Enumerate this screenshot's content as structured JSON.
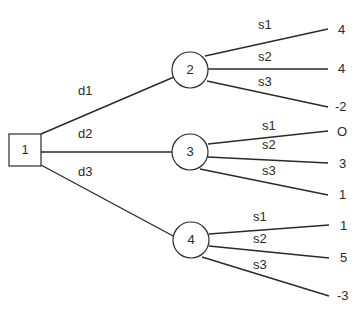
{
  "diagram": {
    "type": "decision-tree",
    "colors": {
      "line": "#2a2a2a",
      "background": "#ffffff"
    },
    "decision_node": {
      "id": "1",
      "label": "1",
      "shape": "square"
    },
    "decisions": [
      {
        "label": "d1",
        "chance_node": {
          "id": "2",
          "label": "2",
          "shape": "circle"
        },
        "outcomes": [
          {
            "state": "s1",
            "payoff": "4"
          },
          {
            "state": "s2",
            "payoff": "4"
          },
          {
            "state": "s3",
            "payoff": "-2"
          }
        ]
      },
      {
        "label": "d2",
        "chance_node": {
          "id": "3",
          "label": "3",
          "shape": "circle"
        },
        "outcomes": [
          {
            "state": "s1",
            "payoff": "O"
          },
          {
            "state": "s2",
            "payoff": "3"
          },
          {
            "state": "s3",
            "payoff": "1"
          }
        ]
      },
      {
        "label": "d3",
        "chance_node": {
          "id": "4",
          "label": "4",
          "shape": "circle"
        },
        "outcomes": [
          {
            "state": "s1",
            "payoff": "1"
          },
          {
            "state": "s2",
            "payoff": "5"
          },
          {
            "state": "s3",
            "payoff": "-3"
          }
        ]
      }
    ]
  }
}
